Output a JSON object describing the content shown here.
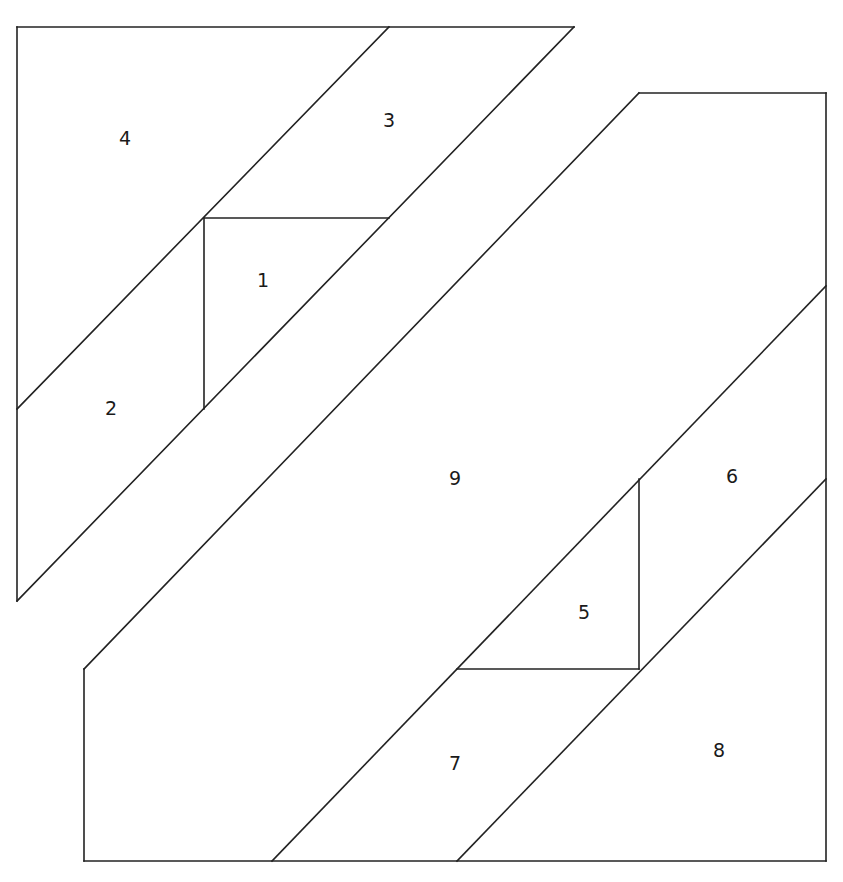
{
  "diagram": {
    "type": "paper-piecing-pattern",
    "stroke_color": "#222222",
    "background": "#ffffff",
    "sections": [
      {
        "name": "upper-left-section",
        "pieces": [
          {
            "label": "1",
            "x": 263,
            "y": 281,
            "polygon": "204,218 389,218 204,409"
          },
          {
            "label": "2",
            "x": 111,
            "y": 409,
            "polygon": "17,409 204,218 204,409 17,601"
          },
          {
            "label": "3",
            "x": 389,
            "y": 121,
            "polygon": "389,27 574,27 204,409 204,218 389,218"
          },
          {
            "label": "4",
            "x": 125,
            "y": 139,
            "polygon": "17,27 389,27 17,409"
          }
        ]
      },
      {
        "name": "lower-right-section",
        "pieces": [
          {
            "label": "5",
            "x": 584,
            "y": 613,
            "polygon": "639,479 639,669 457,669"
          },
          {
            "label": "6",
            "x": 732,
            "y": 477,
            "polygon": "826,286 826,479 639,669 639,479"
          },
          {
            "label": "7",
            "x": 455,
            "y": 764,
            "polygon": "457,669 639,669 457,861 272,861"
          },
          {
            "label": "8",
            "x": 719,
            "y": 751,
            "polygon": "826,479 826,861 457,861"
          },
          {
            "label": "9",
            "x": 455,
            "y": 479,
            "polygon": "639,93 826,93 826,286 272,861 84,861 84,669"
          }
        ]
      }
    ],
    "lines": [
      "17,27 574,27",
      "17,27 17,601",
      "389,27 17,409",
      "574,27 17,601",
      "204,218 389,218",
      "204,218 204,409",
      "639,93 826,93",
      "826,93 826,861",
      "84,861 826,861",
      "84,669 84,861",
      "639,93 84,669",
      "826,286 272,861",
      "826,479 457,861",
      "457,669 639,669",
      "639,479 639,669"
    ]
  }
}
